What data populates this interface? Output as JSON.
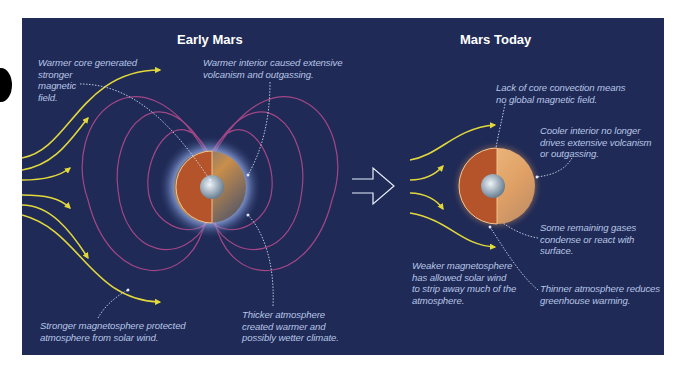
{
  "colors": {
    "background": "#1f2a56",
    "solar_wind": "#e2d83c",
    "field_lines": "#b04a8c",
    "annotation_text": "#b8c6e6",
    "title_text": "#ffffff",
    "mars_interior": "#b5542a",
    "mars_core": "#a9b9c8"
  },
  "early_mars": {
    "title": "Early Mars",
    "notes": {
      "core": "Warmer core generated\nstronger\nmagnetic\nfield.",
      "interior": "Warmer interior caused extensive\nvolcanism and outgassing.",
      "magnetosphere": "Stronger magnetosphere protected\natmosphere from solar wind.",
      "atmosphere": "Thicker atmosphere\ncreated warmer and\npossibly wetter climate."
    }
  },
  "mars_today": {
    "title": "Mars Today",
    "notes": {
      "core": "Lack of core convection means\nno global magnetic field.",
      "interior": "Cooler interior no longer\ndrives extensive volcanism\nor outgassing.",
      "gases": "Some remaining gases\ncondense or react with\nsurface.",
      "magnetosphere": "Weaker magnetosphere\nhas allowed solar wind\nto strip away much of the\natmosphere.",
      "atmosphere": "Thinner atmosphere reduces\ngreenhouse warming."
    }
  },
  "icons": {
    "transition_arrow": "outline-right-arrow",
    "solar_wind": "curved-yellow-arrows",
    "magnetic_field": "dipole-field-lines"
  }
}
